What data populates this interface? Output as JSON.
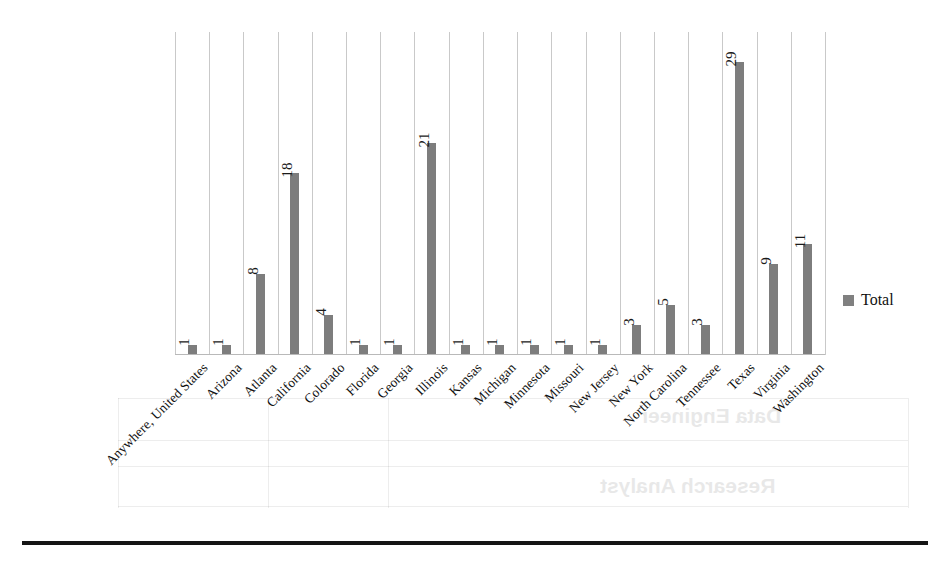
{
  "chart_data": {
    "type": "bar",
    "title": "",
    "xlabel": "",
    "ylabel": "",
    "ylim": [
      0,
      32
    ],
    "grid": "vertical-only",
    "legend_position": "right",
    "orientation": "vertical",
    "bar_color": "#7d7d7d",
    "gridline_color": "#c9c9c9",
    "categories": [
      "Anywhere, United States",
      "Arizona",
      "Atlanta",
      "California",
      "Colorado",
      "Florida",
      "Georgia",
      "Illinois",
      "Kansas",
      "Michigan",
      "Minnesota",
      "Missouri",
      "New Jersey",
      "New York",
      "North Carolina",
      "Tennessee",
      "Texas",
      "Virginia",
      "Washington"
    ],
    "values": [
      1,
      1,
      8,
      18,
      4,
      1,
      1,
      21,
      1,
      1,
      1,
      1,
      1,
      3,
      5,
      3,
      29,
      9,
      11
    ],
    "series": [
      {
        "name": "Total",
        "values": [
          1,
          1,
          8,
          18,
          4,
          1,
          1,
          21,
          1,
          1,
          1,
          1,
          1,
          3,
          5,
          3,
          29,
          9,
          11
        ]
      }
    ]
  },
  "legend": {
    "entries": [
      {
        "label": "Total",
        "color": "#808080"
      }
    ]
  },
  "footer": {
    "caption": ""
  },
  "ghost_text": {
    "lines": [
      "Data Engineer",
      "Research Analyst"
    ]
  }
}
